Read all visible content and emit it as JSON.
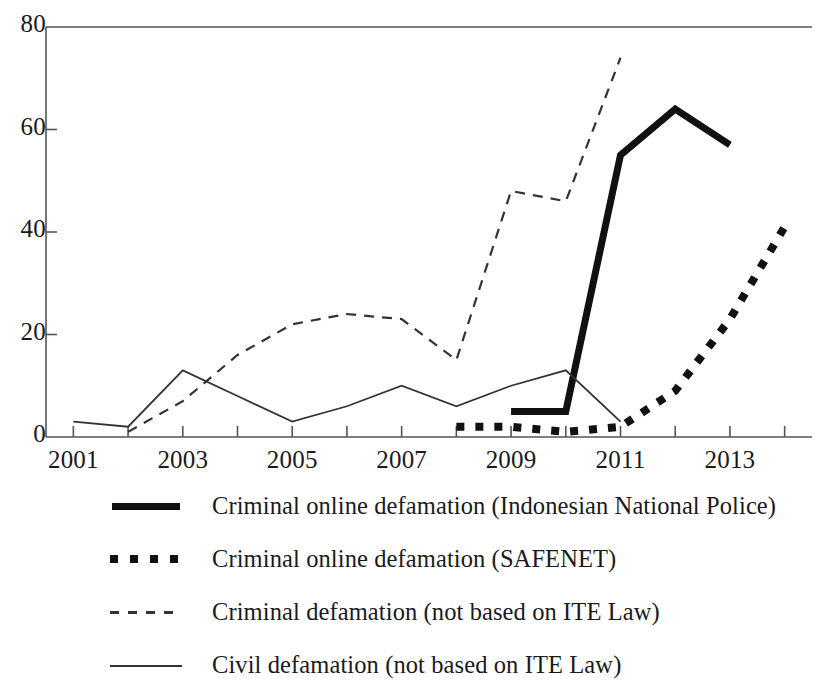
{
  "chart_data": {
    "type": "line",
    "title": "",
    "subtitle": "",
    "xlabel": "",
    "ylabel": "",
    "xlim": [
      2000.5,
      2014.5
    ],
    "ylim": [
      0,
      80
    ],
    "grid": false,
    "legend_position": "below",
    "y_ticks": [
      0,
      20,
      40,
      60,
      80
    ],
    "y_tick_labels": [
      "0",
      "20",
      "40",
      "60",
      "80"
    ],
    "x_ticks": [
      2001,
      2002,
      2003,
      2004,
      2005,
      2006,
      2007,
      2008,
      2009,
      2010,
      2011,
      2012,
      2013,
      2014
    ],
    "x_tick_labels": [
      "2001",
      "",
      "2003",
      "",
      "2005",
      "",
      "2007",
      "",
      "2009",
      "",
      "2011",
      "",
      "2013",
      ""
    ],
    "x_labeled_ticks": [
      {
        "year": 2001,
        "label": "2001"
      },
      {
        "year": 2003,
        "label": "2003"
      },
      {
        "year": 2005,
        "label": "2005"
      },
      {
        "year": 2007,
        "label": "2007"
      },
      {
        "year": 2009,
        "label": "2009"
      },
      {
        "year": 2011,
        "label": "2011"
      },
      {
        "year": 2013,
        "label": "2013"
      }
    ],
    "series": [
      {
        "name": "Criminal online defamation (Indonesian National Police)",
        "style": "thick-solid",
        "color": "#111111",
        "x": [
          2009,
          2010,
          2011,
          2012,
          2013
        ],
        "values": [
          5,
          5,
          55,
          64,
          57
        ]
      },
      {
        "name": "Criminal online defamation (SAFENET)",
        "style": "thick-dotted",
        "color": "#111111",
        "x": [
          2008,
          2009,
          2010,
          2011,
          2012,
          2013,
          2014
        ],
        "values": [
          2,
          2,
          1,
          2,
          9,
          23,
          41
        ]
      },
      {
        "name": "Criminal defamation (not based on ITE Law)",
        "style": "dashed",
        "color": "#333333",
        "x": [
          2002,
          2003,
          2004,
          2005,
          2006,
          2007,
          2008,
          2009,
          2010,
          2011
        ],
        "values": [
          1,
          7,
          16,
          22,
          24,
          23,
          15,
          48,
          46,
          74
        ]
      },
      {
        "name": "Civil defamation (not based on ITE Law)",
        "style": "thin-solid",
        "color": "#333333",
        "x": [
          2001,
          2002,
          2003,
          2004,
          2005,
          2006,
          2007,
          2008,
          2009,
          2010,
          2011
        ],
        "values": [
          3,
          2,
          13,
          8,
          3,
          6,
          10,
          6,
          10,
          13,
          3
        ]
      }
    ]
  },
  "legend": {
    "entries": [
      {
        "label": "Criminal online defamation (Indonesian National Police)",
        "style": "thick-solid"
      },
      {
        "label": "Criminal online defamation (SAFENET)",
        "style": "thick-dotted"
      },
      {
        "label": "Criminal defamation (not based on ITE Law)",
        "style": "dashed"
      },
      {
        "label": "Civil defamation (not based on ITE Law)",
        "style": "thin-solid"
      }
    ]
  }
}
